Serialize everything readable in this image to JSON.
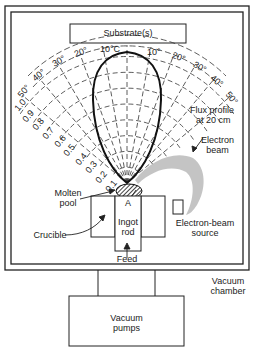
{
  "diagram": {
    "labels": {
      "substrate": "Substrate(s)",
      "flux_profile_line1": "Flux profile",
      "flux_profile_line2": "at 20 cm",
      "electron_beam_line1": "Electron",
      "electron_beam_line2": "beam",
      "molten_pool_line1": "Molten",
      "molten_pool_line2": "pool",
      "point_a": "A",
      "crucible": "Crucible",
      "ingot_line1": "Ingot",
      "ingot_line2": "rod",
      "feed": "Feed",
      "eb_source_line1": "Electron-beam",
      "eb_source_line2": "source",
      "vacuum_chamber_line1": "Vacuum",
      "vacuum_chamber_line2": "chamber",
      "vacuum_pumps_line1": "Vacuum",
      "vacuum_pumps_line2": "pumps"
    },
    "polar_grid": {
      "angle_labels_left": [
        "10°C",
        "20°",
        "30°",
        "40°",
        "50°"
      ],
      "angle_labels_right": [
        "10°",
        "20°",
        "30°",
        "40°",
        "50°"
      ],
      "radial_labels": [
        "0.1",
        "0.2",
        "0.3",
        "0.4",
        "0.5",
        "0.6",
        "0.7",
        "0.8",
        "0.9",
        "1.0"
      ]
    },
    "colors": {
      "line": "#222222",
      "background": "#ffffff",
      "stipple": "#555555"
    }
  }
}
